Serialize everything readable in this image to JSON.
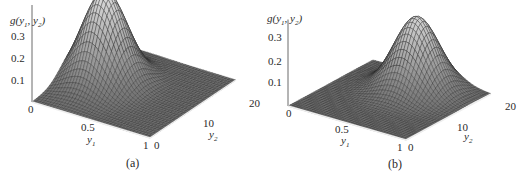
{
  "chart_data": [
    {
      "type": "surface",
      "panel_label": "(a)",
      "zlabel": "g(y₁, y₂)",
      "xlabel": "y₁",
      "ylabel": "y₂",
      "z_ticks": [
        "0.1",
        "0.2",
        "0.3"
      ],
      "x_ticks": [
        "0",
        "0.5",
        "1"
      ],
      "y_ticks": [
        "0",
        "10",
        "20"
      ],
      "x_range": [
        0,
        1
      ],
      "y_range": [
        0,
        20
      ],
      "z_range": [
        0,
        0.35
      ],
      "peak": {
        "y1": 0.25,
        "y2": 10,
        "z": 0.35
      },
      "description": "Bell-shaped surface peaking near the back (low y1), centered in y2"
    },
    {
      "type": "surface",
      "panel_label": "(b)",
      "zlabel": "g(y₁, y₂)",
      "xlabel": "y₁",
      "ylabel": "y₂",
      "z_ticks": [
        "0.1",
        "0.2",
        "0.3"
      ],
      "x_ticks": [
        "0",
        "0.5",
        "1"
      ],
      "y_ticks": [
        "0",
        "10",
        "20"
      ],
      "x_range": [
        0,
        1
      ],
      "y_range": [
        0,
        20
      ],
      "z_range": [
        0,
        0.35
      ],
      "peak": {
        "y1": 0.55,
        "y2": 15,
        "z": 0.32
      },
      "description": "Bell-shaped surface shifted toward higher y2; flat region for low y2"
    }
  ],
  "panels": [
    {
      "caption": "(a)",
      "zlabel_g": "g(y",
      "zlabel_sub1": "1",
      "zlabel_mid": ", y",
      "zlabel_sub2": "2",
      "zlabel_end": ")",
      "zt1": "0.3",
      "zt2": "0.2",
      "zt3": "0.1",
      "xt0": "0",
      "xt1": "0.5",
      "xt2": "1",
      "xl": "y",
      "xlsub": "1",
      "yt0": "0",
      "yt1": "10",
      "yt2": "20",
      "yl": "y",
      "ylsub": "2"
    },
    {
      "caption": "(b)",
      "zlabel_g": "g(y",
      "zlabel_sub1": "1",
      "zlabel_mid": ", y",
      "zlabel_sub2": "2",
      "zlabel_end": ")",
      "zt1": "0.3",
      "zt2": "0.2",
      "zt3": "0.1",
      "xt0": "0",
      "xt1": "0.5",
      "xt2": "1",
      "xl": "y",
      "xlsub": "1",
      "yt0": "0",
      "yt1": "10",
      "yt2": "20",
      "yl": "y",
      "ylsub": "2"
    }
  ]
}
